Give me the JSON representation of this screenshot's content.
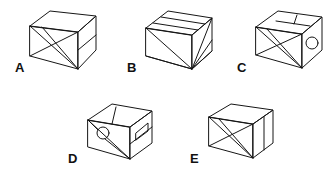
{
  "figure": {
    "kind": "multiple-choice-spatial-reasoning-figure",
    "background_color": "#ffffff",
    "stroke_color": "#161616",
    "canvas": {
      "width": 334,
      "height": 184
    },
    "option_count": 5
  },
  "options": [
    {
      "id": "A",
      "label": "A",
      "label_x": 15,
      "label_y": 61,
      "box_x": 28,
      "box_y": 10,
      "box_w": 70,
      "box_h": 62,
      "has_circle": false,
      "face_marks": "diagonal cross on left face, horizontal split on right face, plain top face",
      "description": "Cube seen from upper-left; left face carries an X of two crossing diagonals, right face is divided by a horizontal line, top face is blank."
    },
    {
      "id": "B",
      "label": "B",
      "label_x": 127,
      "label_y": 61,
      "box_x": 144,
      "box_y": 10,
      "box_w": 70,
      "box_h": 62,
      "has_circle": false,
      "face_marks": "fan of lines converging at bottom vertex, band across top face",
      "description": "Cube with a band across the top face and several lines radiating from the lower front corner across both side faces."
    },
    {
      "id": "C",
      "label": "C",
      "label_x": 237,
      "label_y": 61,
      "box_x": 254,
      "box_y": 10,
      "box_w": 70,
      "box_h": 62,
      "has_circle": true,
      "circle_cx": 299,
      "circle_cy": 42,
      "circle_r": 6,
      "face_marks": "diagonal cross on left face, small circle on right face, panel lines on top face",
      "description": "Cube with crossing diagonals on the left face, a small circle on the right face, and a rectangular panel outlined on the top face."
    },
    {
      "id": "D",
      "label": "D",
      "label_x": 68,
      "label_y": 152,
      "box_x": 86,
      "box_y": 102,
      "box_w": 68,
      "box_h": 60,
      "has_circle": true,
      "circle_cx": 103,
      "circle_cy": 133,
      "circle_r": 6,
      "face_marks": "small circle on left face with converging lines, horizontal split and rectangle on right face",
      "description": "Cube with a small circle on the left face touched by two converging lines, and a divided right face containing a small rectangle."
    },
    {
      "id": "E",
      "label": "E",
      "label_x": 190,
      "label_y": 152,
      "box_x": 207,
      "box_y": 102,
      "box_w": 68,
      "box_h": 60,
      "has_circle": false,
      "face_marks": "diagonal cross on left face, vertical split on right face, plain top face",
      "description": "Cube with an X of crossing diagonals on the left face and a single vertical division line on the right face."
    }
  ]
}
